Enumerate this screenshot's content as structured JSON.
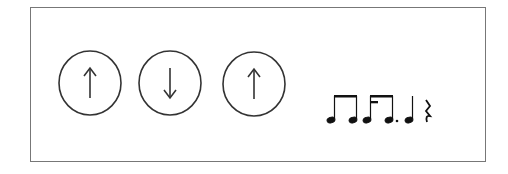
{
  "figure": {
    "strokes": [
      {
        "direction": "up",
        "icon": "up-arrow-icon"
      },
      {
        "direction": "down",
        "icon": "down-arrow-icon"
      },
      {
        "direction": "up",
        "icon": "up-arrow-icon"
      }
    ],
    "rhythm": [
      "eighth-pair",
      "eighth-dotted-sixteenth-group",
      "quarter",
      "quarter-rest"
    ],
    "colors": {
      "stroke": "#333333",
      "border": "#777777"
    }
  }
}
